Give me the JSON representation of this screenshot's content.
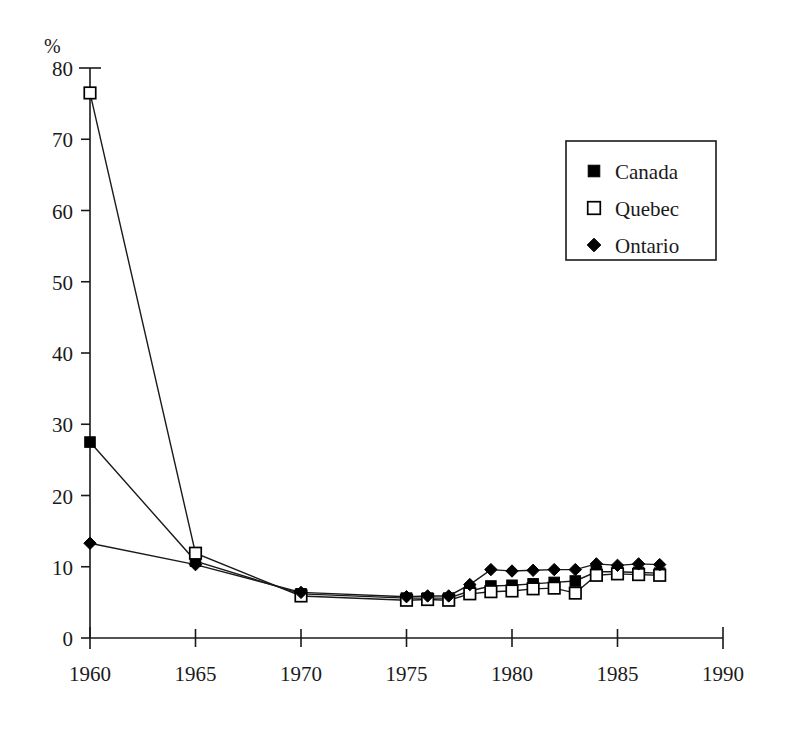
{
  "chart_data": {
    "type": "line",
    "title": "",
    "subtitle": "",
    "xlabel": "",
    "ylabel": "%",
    "unit_label": "%",
    "xlim": [
      1960,
      1990
    ],
    "ylim": [
      0,
      80
    ],
    "xticks": [
      1960,
      1965,
      1970,
      1975,
      1980,
      1985,
      1990
    ],
    "yticks": [
      0,
      10,
      20,
      30,
      40,
      50,
      60,
      70,
      80
    ],
    "xtick_labels": [
      "1960",
      "1965",
      "1970",
      "1975",
      "1980",
      "1985",
      "1990"
    ],
    "ytick_labels": [
      "0",
      "10",
      "20",
      "30",
      "40",
      "50",
      "60",
      "70",
      "80"
    ],
    "grid": false,
    "legend_position": "upper-right",
    "legend_entries": [
      {
        "name": "Canada",
        "marker": "filled-square"
      },
      {
        "name": "Quebec",
        "marker": "open-square"
      },
      {
        "name": "Ontario",
        "marker": "filled-diamond"
      }
    ],
    "series": [
      {
        "name": "Canada",
        "marker": "filled-square",
        "x": [
          1960,
          1965,
          1970,
          1975,
          1976,
          1977,
          1978,
          1979,
          1980,
          1981,
          1982,
          1983,
          1984,
          1985,
          1986,
          1987
        ],
        "values": [
          27.5,
          10.8,
          6.2,
          5.6,
          5.6,
          5.6,
          6.6,
          7.3,
          7.4,
          7.6,
          7.8,
          8.0,
          9.3,
          9.3,
          9.2,
          9.1
        ]
      },
      {
        "name": "Quebec",
        "marker": "open-square",
        "x": [
          1960,
          1965,
          1970,
          1975,
          1976,
          1977,
          1978,
          1979,
          1980,
          1981,
          1982,
          1983,
          1984,
          1985,
          1986,
          1987
        ],
        "values": [
          76.5,
          11.9,
          5.9,
          5.3,
          5.4,
          5.3,
          6.2,
          6.5,
          6.6,
          6.9,
          7.0,
          6.3,
          8.8,
          9.0,
          8.9,
          8.8
        ]
      },
      {
        "name": "Ontario",
        "marker": "filled-diamond",
        "x": [
          1960,
          1965,
          1970,
          1975,
          1976,
          1977,
          1978,
          1979,
          1980,
          1981,
          1982,
          1983,
          1984,
          1985,
          1986,
          1987
        ],
        "values": [
          13.3,
          10.3,
          6.4,
          5.8,
          5.9,
          5.9,
          7.5,
          9.6,
          9.4,
          9.5,
          9.6,
          9.6,
          10.4,
          10.2,
          10.4,
          10.3
        ]
      }
    ]
  },
  "colors": {
    "ink": "#1a1a1a",
    "marker_fill": "#000000",
    "marker_open_fill": "#ffffff",
    "background": "#ffffff"
  }
}
